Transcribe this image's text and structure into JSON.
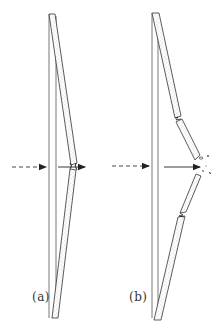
{
  "figure": {
    "panels": [
      {
        "id": "a",
        "label": "(a)",
        "description": "Plate bent by impact, intact strip deflected at midpoint"
      },
      {
        "id": "b",
        "label": "(b)",
        "description": "Plate fractured by impact with debris ejected at midpoint"
      }
    ],
    "colors": {
      "line": "#333333",
      "stipple": "#9a9a9a",
      "background": "#ffffff"
    }
  }
}
